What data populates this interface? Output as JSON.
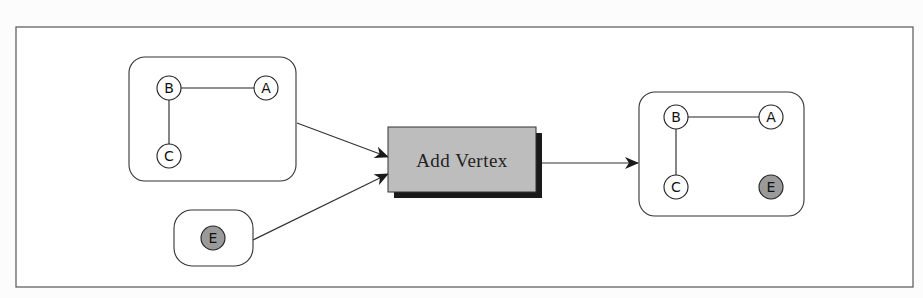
{
  "diagram": {
    "title": "",
    "process": {
      "label": "Add Vertex",
      "fill": "#bdbdbd",
      "shadow": "#1a1a1a"
    },
    "input_graph": {
      "nodes": [
        {
          "id": "B",
          "label": "B",
          "x": 169,
          "y": 88,
          "highlight": false
        },
        {
          "id": "A",
          "label": "A",
          "x": 266,
          "y": 88,
          "highlight": false
        },
        {
          "id": "C",
          "label": "C",
          "x": 169,
          "y": 156,
          "highlight": false
        }
      ],
      "edges": [
        [
          "B",
          "A"
        ],
        [
          "B",
          "C"
        ]
      ]
    },
    "input_vertex": {
      "nodes": [
        {
          "id": "E",
          "label": "E",
          "x": 213,
          "y": 238,
          "highlight": true
        }
      ]
    },
    "output_graph": {
      "nodes": [
        {
          "id": "B",
          "label": "B",
          "x": 676,
          "y": 117,
          "highlight": false
        },
        {
          "id": "A",
          "label": "A",
          "x": 771,
          "y": 117,
          "highlight": false
        },
        {
          "id": "C",
          "label": "C",
          "x": 676,
          "y": 187,
          "highlight": false
        },
        {
          "id": "E",
          "label": "E",
          "x": 771,
          "y": 187,
          "highlight": true
        }
      ],
      "edges": [
        [
          "B",
          "A"
        ],
        [
          "B",
          "C"
        ]
      ]
    },
    "flows": [
      {
        "from": "input_graph",
        "to": "process"
      },
      {
        "from": "input_vertex",
        "to": "process"
      },
      {
        "from": "process",
        "to": "output_graph"
      }
    ],
    "colors": {
      "new_vertex_fill": "#9a9a9a",
      "line": "#222222"
    }
  }
}
